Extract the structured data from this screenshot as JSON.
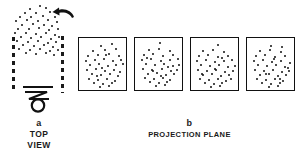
{
  "figure": {
    "panel_a": {
      "letter": "a",
      "caption_line1": "TOP",
      "caption_line2": "VIEW",
      "rotation_arrow": "rotation-arrow-left",
      "observer": "observer-eye-symbol",
      "dashed_lines": [
        "left-projection-boundary",
        "right-projection-boundary"
      ],
      "point_color": "#111111",
      "point_count": 52,
      "points": [
        [
          40,
          6
        ],
        [
          30,
          9
        ],
        [
          46,
          8
        ],
        [
          25,
          13
        ],
        [
          36,
          13
        ],
        [
          50,
          12
        ],
        [
          20,
          17
        ],
        [
          31,
          17
        ],
        [
          43,
          16
        ],
        [
          55,
          17
        ],
        [
          16,
          21
        ],
        [
          27,
          20
        ],
        [
          38,
          21
        ],
        [
          48,
          20
        ],
        [
          57,
          22
        ],
        [
          22,
          25
        ],
        [
          33,
          24
        ],
        [
          44,
          25
        ],
        [
          52,
          26
        ],
        [
          18,
          29
        ],
        [
          29,
          29
        ],
        [
          39,
          28
        ],
        [
          49,
          30
        ],
        [
          58,
          29
        ],
        [
          15,
          33
        ],
        [
          26,
          33
        ],
        [
          36,
          34
        ],
        [
          46,
          33
        ],
        [
          55,
          35
        ],
        [
          21,
          37
        ],
        [
          31,
          38
        ],
        [
          41,
          37
        ],
        [
          51,
          39
        ],
        [
          59,
          37
        ],
        [
          17,
          41
        ],
        [
          28,
          42
        ],
        [
          38,
          41
        ],
        [
          48,
          43
        ],
        [
          56,
          42
        ],
        [
          23,
          45
        ],
        [
          34,
          46
        ],
        [
          44,
          45
        ],
        [
          53,
          47
        ],
        [
          19,
          49
        ],
        [
          30,
          50
        ],
        [
          40,
          49
        ],
        [
          50,
          51
        ],
        [
          58,
          50
        ],
        [
          26,
          53
        ],
        [
          36,
          54
        ],
        [
          46,
          53
        ],
        [
          54,
          55
        ]
      ]
    },
    "panel_b": {
      "letter": "b",
      "caption_line1": "PROJECTION  PLANE",
      "frame_color": "#111111",
      "point_color": "#111111",
      "boxes": [
        {
          "name": "projection-frame-1",
          "points": [
            [
              22,
              8
            ],
            [
              33,
              6
            ],
            [
              14,
              13
            ],
            [
              26,
              12
            ],
            [
              37,
              11
            ],
            [
              9,
              18
            ],
            [
              19,
              17
            ],
            [
              30,
              16
            ],
            [
              40,
              18
            ],
            [
              7,
              23
            ],
            [
              16,
              22
            ],
            [
              25,
              21
            ],
            [
              34,
              23
            ],
            [
              42,
              22
            ],
            [
              11,
              27
            ],
            [
              20,
              26
            ],
            [
              29,
              28
            ],
            [
              37,
              27
            ],
            [
              44,
              26
            ],
            [
              8,
              32
            ],
            [
              17,
              31
            ],
            [
              26,
              33
            ],
            [
              35,
              32
            ],
            [
              41,
              34
            ],
            [
              13,
              36
            ],
            [
              22,
              37
            ],
            [
              31,
              36
            ],
            [
              39,
              38
            ],
            [
              10,
              41
            ],
            [
              19,
              42
            ],
            [
              28,
              41
            ],
            [
              36,
              43
            ],
            [
              15,
              45
            ],
            [
              24,
              46
            ],
            [
              33,
              45
            ],
            [
              21,
              49
            ],
            [
              30,
              48
            ],
            [
              27,
              17
            ],
            [
              23,
              30
            ],
            [
              18,
              38
            ]
          ]
        },
        {
          "name": "projection-frame-2",
          "points": [
            [
              25,
              5
            ],
            [
              14,
              12
            ],
            [
              24,
              11
            ],
            [
              35,
              13
            ],
            [
              9,
              17
            ],
            [
              18,
              16
            ],
            [
              28,
              18
            ],
            [
              38,
              17
            ],
            [
              7,
              22
            ],
            [
              16,
              21
            ],
            [
              26,
              23
            ],
            [
              35,
              22
            ],
            [
              43,
              21
            ],
            [
              11,
              26
            ],
            [
              20,
              27
            ],
            [
              29,
              26
            ],
            [
              38,
              28
            ],
            [
              44,
              27
            ],
            [
              8,
              31
            ],
            [
              17,
              32
            ],
            [
              27,
              31
            ],
            [
              36,
              33
            ],
            [
              42,
              32
            ],
            [
              13,
              36
            ],
            [
              22,
              35
            ],
            [
              31,
              37
            ],
            [
              39,
              36
            ],
            [
              10,
              40
            ],
            [
              19,
              41
            ],
            [
              28,
              40
            ],
            [
              35,
              42
            ],
            [
              15,
              44
            ],
            [
              24,
              45
            ],
            [
              32,
              44
            ],
            [
              21,
              48
            ],
            [
              30,
              47
            ],
            [
              12,
              20
            ],
            [
              33,
              29
            ],
            [
              26,
              38
            ],
            [
              18,
              33
            ]
          ]
        },
        {
          "name": "projection-frame-3",
          "points": [
            [
              27,
              7
            ],
            [
              12,
              13
            ],
            [
              22,
              12
            ],
            [
              33,
              14
            ],
            [
              8,
              18
            ],
            [
              17,
              17
            ],
            [
              27,
              19
            ],
            [
              37,
              18
            ],
            [
              6,
              23
            ],
            [
              15,
              22
            ],
            [
              24,
              24
            ],
            [
              33,
              23
            ],
            [
              41,
              22
            ],
            [
              10,
              27
            ],
            [
              19,
              28
            ],
            [
              28,
              27
            ],
            [
              37,
              29
            ],
            [
              44,
              28
            ],
            [
              7,
              32
            ],
            [
              16,
              33
            ],
            [
              25,
              32
            ],
            [
              34,
              34
            ],
            [
              42,
              33
            ],
            [
              12,
              37
            ],
            [
              21,
              36
            ],
            [
              30,
              38
            ],
            [
              38,
              37
            ],
            [
              9,
              41
            ],
            [
              18,
              42
            ],
            [
              27,
              41
            ],
            [
              35,
              43
            ],
            [
              14,
              45
            ],
            [
              23,
              46
            ],
            [
              31,
              45
            ],
            [
              20,
              49
            ],
            [
              29,
              48
            ],
            [
              40,
              41
            ],
            [
              11,
              36
            ],
            [
              31,
              20
            ],
            [
              24,
              31
            ]
          ]
        },
        {
          "name": "projection-frame-4",
          "points": [
            [
              24,
              8
            ],
            [
              35,
              9
            ],
            [
              13,
              13
            ],
            [
              23,
              12
            ],
            [
              34,
              14
            ],
            [
              9,
              18
            ],
            [
              18,
              17
            ],
            [
              28,
              19
            ],
            [
              38,
              18
            ],
            [
              7,
              23
            ],
            [
              16,
              22
            ],
            [
              25,
              24
            ],
            [
              34,
              23
            ],
            [
              43,
              25
            ],
            [
              11,
              27
            ],
            [
              20,
              28
            ],
            [
              29,
              27
            ],
            [
              38,
              29
            ],
            [
              8,
              32
            ],
            [
              17,
              33
            ],
            [
              26,
              32
            ],
            [
              35,
              34
            ],
            [
              42,
              33
            ],
            [
              13,
              37
            ],
            [
              22,
              36
            ],
            [
              31,
              38
            ],
            [
              39,
              37
            ],
            [
              10,
              41
            ],
            [
              19,
              42
            ],
            [
              28,
              41
            ],
            [
              36,
              43
            ],
            [
              15,
              45
            ],
            [
              24,
              46
            ],
            [
              33,
              45
            ],
            [
              22,
              49
            ],
            [
              31,
              48
            ],
            [
              41,
              30
            ],
            [
              27,
              21
            ],
            [
              19,
              36
            ],
            [
              33,
              41
            ]
          ]
        }
      ]
    }
  }
}
